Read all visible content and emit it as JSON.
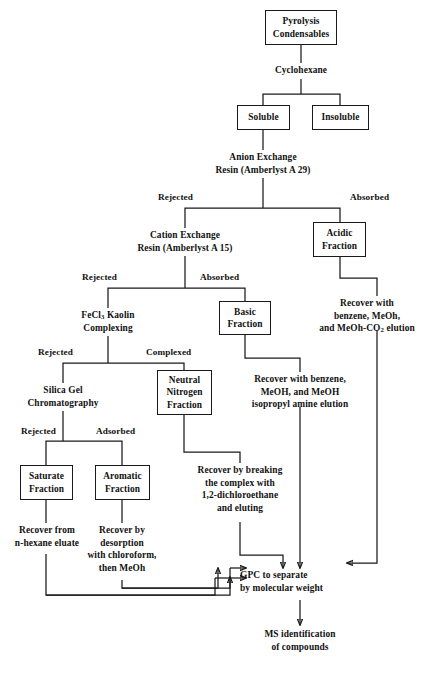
{
  "diagram": {
    "line_color": "#1a1a1a",
    "background": "#ffffff"
  },
  "nodes": {
    "pyrolysis_condensables": {
      "line1": "Pyrolysis",
      "line2": "Condensables"
    },
    "cyclohexane": {
      "line1": "Cyclohexane"
    },
    "soluble": {
      "line1": "Soluble"
    },
    "insoluble": {
      "line1": "Insoluble"
    },
    "anion_exchange": {
      "line1": "Anion Exchange",
      "line2": "Resin (Amberlyst A 29)"
    },
    "cation_exchange": {
      "line1": "Cation Exchange",
      "line2": "Resin (Amberlyst A 15)"
    },
    "acidic_fraction": {
      "line1": "Acidic",
      "line2": "Fraction"
    },
    "fecl3_kaolin": {
      "line1": "FeCl3 Kaolin",
      "line1_prefix": "FeCl",
      "line1_sub": "3",
      "line1_suffix": " Kaolin",
      "line2": "Complexing"
    },
    "basic_fraction": {
      "line1": "Basic",
      "line2": "Fraction"
    },
    "recover_acidic": {
      "line1": "Recover with",
      "line2": "benzene, MeOh,",
      "line3_prefix": "and MeOh-CO",
      "line3_sub": "2",
      "line3_suffix": " elution"
    },
    "silica_gel": {
      "line1": "Silica Gel",
      "line2": "Chromatography"
    },
    "neutral_nitrogen": {
      "line1": "Neutral",
      "line2": "Nitrogen",
      "line3": "Fraction"
    },
    "recover_basic": {
      "line1": "Recover with benzene,",
      "line2": "MeOH, and MeOH",
      "line3": "isopropyl amine elution"
    },
    "saturate_fraction": {
      "line1": "Saturate",
      "line2": "Fraction"
    },
    "aromatic_fraction": {
      "line1": "Aromatic",
      "line2": "Fraction"
    },
    "recover_neutral": {
      "line1": "Recover by breaking",
      "line2": "the complex with",
      "line3": "1,2-dichloroethane",
      "line4": "and eluting"
    },
    "recover_saturate": {
      "line1": "Recover from",
      "line2": "n-hexane eluate"
    },
    "recover_aromatic": {
      "line1": "Recover by",
      "line2": "desorption",
      "line3": "with chloroform,",
      "line4": "then MeOh"
    },
    "gpc": {
      "line1": "GPC to separate",
      "line2": "by molecular weight"
    },
    "ms_identification": {
      "line1": "MS identification",
      "line2": "of compounds"
    }
  },
  "edge_labels": {
    "anion_rejected": "Rejected",
    "anion_absorbed": "Absorbed",
    "cation_rejected": "Rejected",
    "cation_absorbed": "Absorbed",
    "fecl3_rejected": "Rejected",
    "fecl3_complexed": "Complexed",
    "silica_rejected": "Rejected",
    "silica_adsorbed": "Adsorbed"
  }
}
